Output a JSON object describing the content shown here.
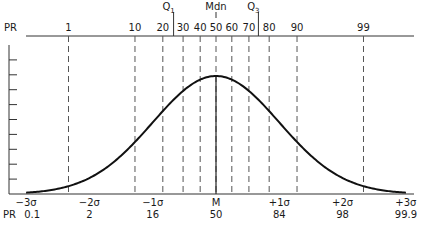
{
  "chart_data": {
    "type": "line",
    "title": "",
    "subtitle": "",
    "top_axis": {
      "label": "PR",
      "percentile_ticks": [
        {
          "label": "1",
          "z": -2.33
        },
        {
          "label": "10",
          "z": -1.28
        },
        {
          "label": "20",
          "z": -0.84
        },
        {
          "label": "30",
          "z": -0.52
        },
        {
          "label": "40",
          "z": -0.25
        },
        {
          "label": "50",
          "z": 0
        },
        {
          "label": "60",
          "z": 0.25
        },
        {
          "label": "70",
          "z": 0.52
        },
        {
          "label": "80",
          "z": 0.84
        },
        {
          "label": "90",
          "z": 1.28
        },
        {
          "label": "99",
          "z": 2.33
        }
      ],
      "markers": [
        {
          "label": "Q1",
          "sub": "1",
          "base": "Q",
          "z": -0.67
        },
        {
          "label": "Mdn",
          "sub": "",
          "base": "Mdn",
          "z": 0
        },
        {
          "label": "Q3",
          "sub": "3",
          "base": "Q",
          "z": 0.67
        }
      ]
    },
    "bottom_axis": {
      "sigma_labels": [
        "−3σ",
        "−2σ",
        "−1σ",
        "M",
        "+1σ",
        "+2σ",
        "+3σ"
      ],
      "z_values": [
        -3,
        -2,
        -1,
        0,
        1,
        2,
        3
      ],
      "pr_row_label": "PR",
      "pr_values": [
        "0.1",
        "2",
        "16",
        "50",
        "84",
        "98",
        "99.9"
      ]
    },
    "curve": {
      "distribution": "normal",
      "mean": 0,
      "sd": 1,
      "x_range": [
        -3,
        3
      ]
    },
    "xlim": [
      -3,
      3
    ],
    "grid": false,
    "legend": "none",
    "left_axis_ticks": 10
  }
}
